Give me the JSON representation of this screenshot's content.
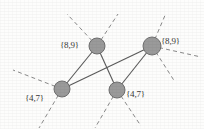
{
  "figure": {
    "width": 204,
    "height": 129,
    "background_color": "#fdfdfc"
  },
  "style": {
    "node_fill": "#9a9a9a",
    "node_stroke": "#6f6f6f",
    "node_radius": 8,
    "solid_edge_color": "#5a5a5a",
    "dashed_edge_color": "#8a8a8a",
    "label_color": "#3a3a3a",
    "label_font_size": 9
  },
  "nodes": [
    {
      "id": "n1",
      "name": "node-top-left",
      "cx": 97,
      "cy": 46,
      "r": 8,
      "label": "{8,9}",
      "label_x": 60,
      "label_y": 41,
      "label_side": "left"
    },
    {
      "id": "n2",
      "name": "node-top-right",
      "cx": 152,
      "cy": 46,
      "r": 9,
      "label": "{8,9}",
      "label_x": 161,
      "label_y": 37,
      "label_side": "right"
    },
    {
      "id": "n3",
      "name": "node-bottom-left",
      "cx": 62,
      "cy": 89,
      "r": 8,
      "label": "{4,7}",
      "label_x": 25,
      "label_y": 94,
      "label_side": "left"
    },
    {
      "id": "n4",
      "name": "node-bottom-middle",
      "cx": 117,
      "cy": 90,
      "r": 8,
      "label": "{4,7}",
      "label_x": 126,
      "label_y": 90,
      "label_side": "right"
    }
  ],
  "solid_edges": [
    {
      "name": "edge-top-left-to-bottom-left",
      "x1": 97,
      "y1": 46,
      "x2": 62,
      "y2": 89
    },
    {
      "name": "edge-top-left-to-bottom-middle",
      "x1": 97,
      "y1": 46,
      "x2": 117,
      "y2": 90
    },
    {
      "name": "edge-bottom-left-to-top-right",
      "x1": 62,
      "y1": 89,
      "x2": 152,
      "y2": 46
    },
    {
      "name": "edge-top-right-to-bottom-middle",
      "x1": 152,
      "y1": 46,
      "x2": 117,
      "y2": 90
    }
  ],
  "dashed_edges": [
    {
      "name": "dashed-top-left-upleft",
      "x1": 97,
      "y1": 46,
      "x2": 67,
      "y2": 14
    },
    {
      "name": "dashed-top-left-upright",
      "x1": 97,
      "y1": 46,
      "x2": 118,
      "y2": 14
    },
    {
      "name": "dashed-top-right-up",
      "x1": 152,
      "y1": 46,
      "x2": 166,
      "y2": 13
    },
    {
      "name": "dashed-top-right-right",
      "x1": 152,
      "y1": 46,
      "x2": 201,
      "y2": 57
    },
    {
      "name": "dashed-top-right-downright",
      "x1": 152,
      "y1": 46,
      "x2": 175,
      "y2": 82
    },
    {
      "name": "dashed-bottom-left-upleft",
      "x1": 62,
      "y1": 89,
      "x2": 13,
      "y2": 70
    },
    {
      "name": "dashed-bottom-left-downleft",
      "x1": 62,
      "y1": 89,
      "x2": 39,
      "y2": 128
    },
    {
      "name": "dashed-bottom-middle-downleft",
      "x1": 117,
      "y1": 90,
      "x2": 95,
      "y2": 128
    },
    {
      "name": "dashed-bottom-middle-downright",
      "x1": 117,
      "y1": 90,
      "x2": 141,
      "y2": 126
    }
  ]
}
